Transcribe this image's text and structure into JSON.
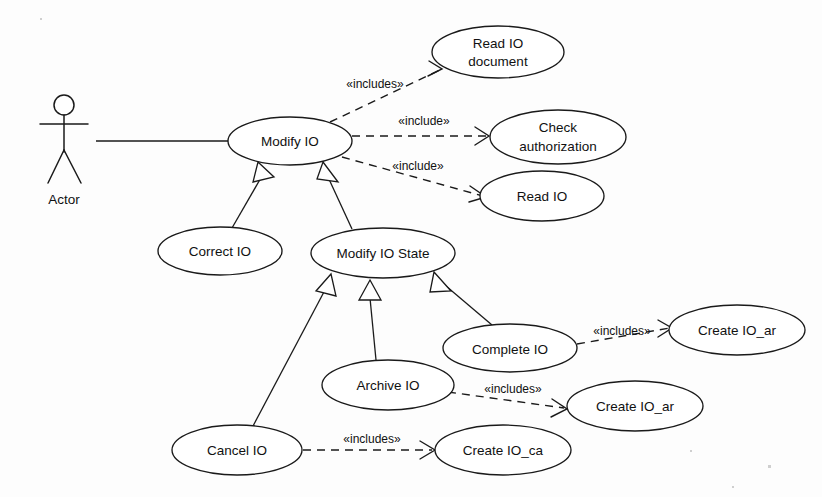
{
  "diagram": {
    "type": "uml-use-case-diagram",
    "background_color": "#fdfdfd",
    "line_color": "#1a1a1a",
    "fill_color": "#ffffff"
  },
  "actor": {
    "label": "Actor",
    "cx": 64,
    "cy": 145,
    "label_x": 64,
    "label_y": 200
  },
  "use_cases": [
    {
      "id": "modify_io",
      "label": "Modify IO",
      "cx": 290,
      "cy": 141,
      "rx": 62,
      "ry": 24
    },
    {
      "id": "read_io_document",
      "label": "Read IO document",
      "line1": "Read IO",
      "line2": "document",
      "cx": 498,
      "cy": 52,
      "rx": 66,
      "ry": 26
    },
    {
      "id": "check_auth",
      "label": "Check authorization",
      "line1": "Check",
      "line2": "authorization",
      "cx": 558,
      "cy": 137,
      "rx": 68,
      "ry": 27
    },
    {
      "id": "read_io",
      "label": "Read IO",
      "cx": 542,
      "cy": 196,
      "rx": 62,
      "ry": 25
    },
    {
      "id": "correct_io",
      "label": "Correct IO",
      "cx": 220,
      "cy": 251,
      "rx": 62,
      "ry": 24
    },
    {
      "id": "modify_io_state",
      "label": "Modify IO State",
      "cx": 383,
      "cy": 253,
      "rx": 72,
      "ry": 25
    },
    {
      "id": "complete_io",
      "label": "Complete IO",
      "cx": 510,
      "cy": 348,
      "rx": 67,
      "ry": 24
    },
    {
      "id": "create_io_ar_1",
      "label": "Create IO_ar",
      "cx": 737,
      "cy": 330,
      "rx": 68,
      "ry": 25
    },
    {
      "id": "archive_io",
      "label": "Archive IO",
      "cx": 388,
      "cy": 385,
      "rx": 66,
      "ry": 25
    },
    {
      "id": "create_io_ar_2",
      "label": "Create IO_ar",
      "cx": 635,
      "cy": 406,
      "rx": 68,
      "ry": 25
    },
    {
      "id": "cancel_io",
      "label": "Cancel IO",
      "cx": 237,
      "cy": 450,
      "rx": 65,
      "ry": 25
    },
    {
      "id": "create_io_ca",
      "label": "Create IO_ca",
      "cx": 503,
      "cy": 450,
      "rx": 68,
      "ry": 25
    }
  ],
  "associations": [
    {
      "id": "actor_to_modify_io",
      "from": "actor",
      "to": "modify_io",
      "x1": 96,
      "y1": 141,
      "x2": 228,
      "y2": 141
    }
  ],
  "generalizations": [
    {
      "id": "correct_io_to_modify_io",
      "from": "correct_io",
      "to": "modify_io",
      "x1": 232,
      "y1": 227,
      "x2": 268,
      "y2": 167
    },
    {
      "id": "modify_io_state_to_modify_io",
      "from": "modify_io_state",
      "to": "modify_io",
      "x1": 350,
      "y1": 229,
      "x2": 322,
      "y2": 167
    },
    {
      "id": "cancel_io_to_modify_io_state",
      "from": "cancel_io",
      "to": "modify_io_state",
      "x1": 253,
      "y1": 426,
      "x2": 332,
      "y2": 272
    },
    {
      "id": "archive_io_to_modify_io_state",
      "from": "archive_io",
      "to": "modify_io_state",
      "x1": 375,
      "y1": 360,
      "x2": 372,
      "y2": 280
    },
    {
      "id": "complete_io_to_modify_io_state",
      "from": "complete_io",
      "to": "modify_io_state",
      "x1": 490,
      "y1": 325,
      "x2": 430,
      "y2": 272
    }
  ],
  "includes": [
    {
      "id": "modify_io_includes_read_io_document",
      "from": "modify_io",
      "to": "read_io_document",
      "label": "«includes»",
      "x1": 330,
      "y1": 122,
      "x2": 440,
      "y2": 70,
      "label_x": 375,
      "label_y": 85
    },
    {
      "id": "modify_io_includes_check_auth",
      "from": "modify_io",
      "to": "check_auth",
      "label": "«include»",
      "x1": 352,
      "y1": 136,
      "x2": 487,
      "y2": 136,
      "label_x": 424,
      "label_y": 122
    },
    {
      "id": "modify_io_includes_read_io",
      "from": "modify_io",
      "to": "read_io",
      "label": "«include»",
      "x1": 342,
      "y1": 157,
      "x2": 484,
      "y2": 196,
      "label_x": 418,
      "label_y": 167
    },
    {
      "id": "complete_io_includes_create_io_ar",
      "from": "complete_io",
      "to": "create_io_ar_1",
      "label": "«includes»",
      "x1": 577,
      "y1": 344,
      "x2": 672,
      "y2": 328,
      "label_x": 622,
      "label_y": 332
    },
    {
      "id": "archive_io_includes_create_io_ar",
      "from": "archive_io",
      "to": "create_io_ar_2",
      "label": "«includes»",
      "x1": 448,
      "y1": 392,
      "x2": 566,
      "y2": 409,
      "label_x": 513,
      "label_y": 390
    },
    {
      "id": "cancel_io_includes_create_io_ca",
      "from": "cancel_io",
      "to": "create_io_ca",
      "label": "«includes»",
      "x1": 303,
      "y1": 450,
      "x2": 434,
      "y2": 450,
      "label_x": 372,
      "label_y": 440
    }
  ]
}
